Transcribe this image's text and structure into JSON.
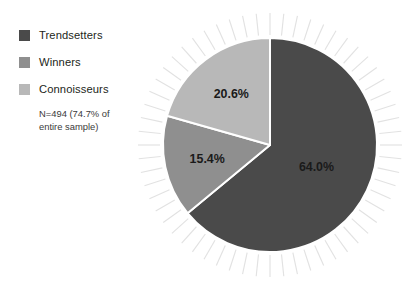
{
  "chart_data": {
    "type": "pie",
    "title": "",
    "subtitle": "",
    "xlabel": "",
    "ylabel": "",
    "legend_position": "left",
    "grid": false,
    "note": "N=494 (74.7% of entire sample)",
    "categories": [
      "Trendsetters",
      "Winners",
      "Connoisseurs"
    ],
    "values": [
      64.0,
      15.4,
      20.6
    ],
    "value_labels": [
      "64.0%",
      "15.4%",
      "20.6%"
    ],
    "colors": [
      "#4a4a4a",
      "#8f8f8f",
      "#b8b8b8"
    ],
    "slices": [
      {
        "label": "Trendsetters",
        "value": 64.0,
        "value_label": "64.0%",
        "color": "#4a4a4a"
      },
      {
        "label": "Winners",
        "value": 15.4,
        "value_label": "15.4%",
        "color": "#8f8f8f"
      },
      {
        "label": "Connoisseurs",
        "value": 20.6,
        "value_label": "20.6%",
        "color": "#b8b8b8"
      }
    ]
  },
  "legend": {
    "items": [
      {
        "label": "Trendsetters",
        "color": "#4a4a4a"
      },
      {
        "label": "Winners",
        "color": "#8f8f8f"
      },
      {
        "label": "Connoisseurs",
        "color": "#b8b8b8"
      }
    ],
    "note_line1": "N=494 (74.7% of",
    "note_line2": "entire sample)"
  },
  "style": {
    "background": "#ffffff",
    "separator_color": "#ffffff",
    "ray_color": "#e2e2e2",
    "label_color": "#1a1a1a"
  },
  "geometry": {
    "center_x": 270,
    "center_y": 145,
    "radius": 107,
    "start_angle_deg": -90,
    "direction": "clockwise",
    "ray_count": 60,
    "ray_inner_offset": 3,
    "ray_length": 22
  }
}
